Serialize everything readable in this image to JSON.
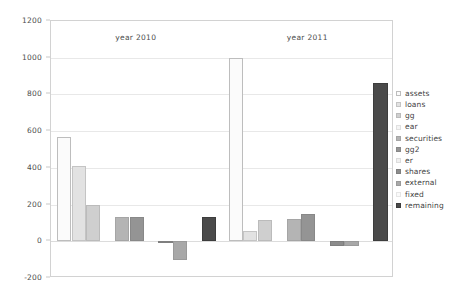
{
  "chart_data": {
    "type": "bar",
    "title": "",
    "subtitle": "",
    "xlabel": "",
    "ylabel": "",
    "ylim": [
      -200,
      1200
    ],
    "yticks": [
      1200,
      1000,
      800,
      600,
      400,
      200,
      0,
      -200
    ],
    "ytick_labels": [
      "1200",
      "1000",
      "800",
      "600",
      "400",
      "200",
      "0",
      "-200"
    ],
    "grid": true,
    "legend_position": "right-outside",
    "categories": [
      "year 2010",
      "year 2011"
    ],
    "series": [
      {
        "name": "assets",
        "color": "#fbfbfb",
        "edge": "#bdbdbd",
        "values": [
          570,
          1000
        ]
      },
      {
        "name": "loans",
        "color": "#e2e2e2",
        "edge": "#c4c4c4",
        "values": [
          410,
          55
        ]
      },
      {
        "name": "gg",
        "color": "#cfcfcf",
        "edge": "#bbbbbb",
        "values": [
          200,
          115
        ]
      },
      {
        "name": "ear",
        "color": "#f4f4f4",
        "edge": "#e0e0e0",
        "values": [
          0,
          0
        ]
      },
      {
        "name": "securities",
        "color": "#b4b4b4",
        "edge": "#a5a5a5",
        "values": [
          135,
          120
        ]
      },
      {
        "name": "gg2",
        "color": "#949494",
        "edge": "#888888",
        "values": [
          135,
          150
        ]
      },
      {
        "name": "er",
        "color": "#f0f0f0",
        "edge": "#dcdcdc",
        "values": [
          0,
          0
        ]
      },
      {
        "name": "shares",
        "color": "#8c8c8c",
        "edge": "#7f7f7f",
        "values": [
          -10,
          -25
        ]
      },
      {
        "name": "external",
        "color": "#a8a8a8",
        "edge": "#9a9a9a",
        "values": [
          -100,
          -25
        ]
      },
      {
        "name": "fixed",
        "color": "#fafafa",
        "edge": "#e6e6e6",
        "values": [
          0,
          0
        ]
      },
      {
        "name": "remaining",
        "color": "#4a4a4a",
        "edge": "#3d3d3d",
        "values": [
          130,
          860
        ]
      }
    ]
  },
  "legend": {
    "items": [
      {
        "label": "assets"
      },
      {
        "label": "loans"
      },
      {
        "label": "gg"
      },
      {
        "label": "ear"
      },
      {
        "label": "securities"
      },
      {
        "label": "gg2"
      },
      {
        "label": "er"
      },
      {
        "label": "shares"
      },
      {
        "label": "external"
      },
      {
        "label": "fixed"
      },
      {
        "label": "remaining"
      }
    ]
  },
  "colors": {
    "frame": "#d2d2d2",
    "grid": "#e8e8e8",
    "text": "#4d4d4d",
    "background": "#ffffff"
  }
}
